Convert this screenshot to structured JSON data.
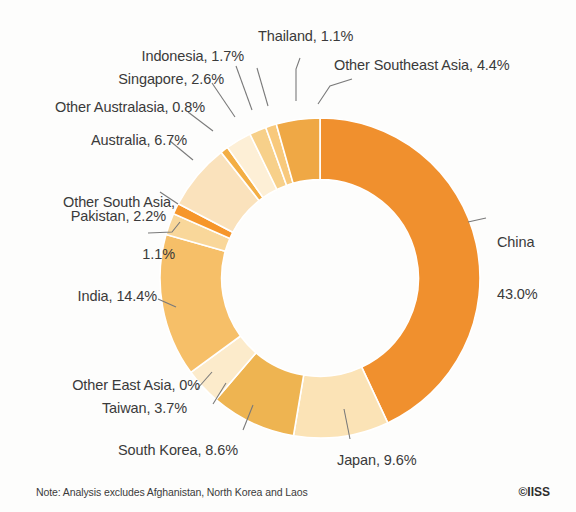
{
  "note": {
    "text": "Note: Analysis excludes Afghanistan, North Korea and Laos",
    "copyright": "©IISS"
  },
  "labels": {
    "china_l1": "China",
    "china_l2": "43.0%",
    "other_south_asia_l1": "Other South Asia,",
    "other_south_asia_l2": "1.1%",
    "indonesia": "Indonesia, 1.7%",
    "singapore": "Singapore, 2.6%",
    "other_australasia": "Other Australasia, 0.8%",
    "australia": "Australia, 6.7%",
    "pakistan": "Pakistan, 2.2%",
    "india": "India, 14.4%",
    "other_east_asia": "Other East Asia, 0%",
    "taiwan": "Taiwan, 3.7%",
    "south_korea": "South Korea, 8.6%",
    "japan": "Japan, 9.6%",
    "thailand": "Thailand, 1.1%",
    "other_southeast_asia": "Other Southeast Asia, 4.4%"
  },
  "chart_data": {
    "type": "pie",
    "variant": "donut",
    "title": "",
    "xlabel": "",
    "ylabel": "",
    "units": "percent",
    "start_angle_deg": 0,
    "direction": "clockwise",
    "inner_radius_ratio": 0.615,
    "legend": "none",
    "grid": false,
    "labels_style": "outside-with-leader-lines",
    "note": "Note: Analysis excludes Afghanistan, North Korea and Laos",
    "categories": [
      "China",
      "Japan",
      "South Korea",
      "Taiwan",
      "Other East Asia",
      "India",
      "Pakistan",
      "Other South Asia",
      "Australia",
      "Other Australasia",
      "Singapore",
      "Indonesia",
      "Thailand",
      "Other Southeast Asia"
    ],
    "values": [
      43.0,
      9.6,
      8.6,
      3.7,
      0,
      14.4,
      2.2,
      1.1,
      6.7,
      0.8,
      2.6,
      1.7,
      1.1,
      4.4
    ],
    "value_labels": [
      "43.0%",
      "9.6%",
      "8.6%",
      "3.7%",
      "0%",
      "14.4%",
      "2.2%",
      "1.1%",
      "6.7%",
      "0.8%",
      "2.6%",
      "1.7%",
      "1.1%",
      "4.4%"
    ],
    "colors": [
      "#F0902E",
      "#FBE3B6",
      "#EEB451",
      "#FCEBCB",
      "#FAE0AE",
      "#F6BF68",
      "#F9D79A",
      "#F6962B",
      "#FAE2BC",
      "#F3AE44",
      "#FDEFD6",
      "#F7D08A",
      "#F8C97C",
      "#EFA845"
    ],
    "slice_separator_color": "#ffffff"
  },
  "colors": {
    "background": "#fdfdfc",
    "text": "#3a3a3a",
    "leader_line": "#7a7a7a",
    "accent": "#F0902E"
  }
}
